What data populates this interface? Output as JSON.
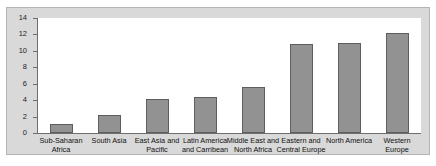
{
  "chart_data": {
    "type": "bar",
    "title": "",
    "subtitle": "",
    "xlabel": "",
    "ylabel": "",
    "ylim": [
      0,
      14
    ],
    "yticks": [
      0,
      2,
      4,
      6,
      8,
      10,
      12,
      14
    ],
    "ytick_labels": [
      "0",
      "2",
      "4",
      "6",
      "8",
      "10",
      "12",
      "14"
    ],
    "grid": false,
    "legend": null,
    "categories": [
      "Sub-Saharan Africa",
      "South Asia",
      "East Asia and Pacific",
      "Latin America and Carribean",
      "Middle East and North Africa",
      "Eastern and Central Europe",
      "North America",
      "Western Europe"
    ],
    "category_lines": [
      [
        "Sub-Saharan",
        "Africa"
      ],
      [
        "South Asia"
      ],
      [
        "East Asia and",
        "Pacific"
      ],
      [
        "Latin America",
        "and Carribean"
      ],
      [
        "Middle East and",
        "North Africa"
      ],
      [
        "Eastern and",
        "Central Europe"
      ],
      [
        "North America"
      ],
      [
        "Western",
        "Europe"
      ]
    ],
    "values": [
      1.1,
      2.2,
      4.2,
      4.4,
      5.6,
      10.8,
      11.0,
      12.2
    ],
    "series": [
      {
        "name": "",
        "values": [
          1.1,
          2.2,
          4.2,
          4.4,
          5.6,
          10.8,
          11.0,
          12.2
        ]
      }
    ],
    "colors": {
      "bar_fill": "#929292",
      "bar_border": "#5d5d5d",
      "axis": "#6e6e6e",
      "panel_background": "#d9d9d9",
      "plot_background": "#ffffff",
      "text": "#111111"
    }
  }
}
